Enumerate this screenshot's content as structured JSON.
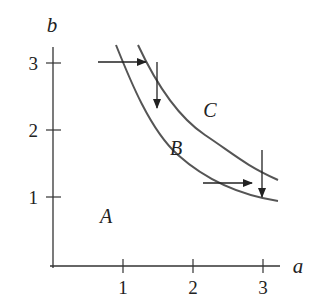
{
  "diagram": {
    "axes": {
      "x_label": "a",
      "y_label": "b",
      "x_ticks": [
        "1",
        "2",
        "3"
      ],
      "y_ticks": [
        "1",
        "2",
        "3"
      ]
    },
    "regions": {
      "A": "A",
      "B": "B",
      "C": "C"
    },
    "curves": [
      {
        "name": "inner-curve",
        "equation": "ab = 3"
      },
      {
        "name": "outer-curve",
        "equation": "ab = 4"
      }
    ],
    "arrows": [
      {
        "name": "upper-horizontal-arrow",
        "direction": "right"
      },
      {
        "name": "upper-vertical-arrow",
        "direction": "down"
      },
      {
        "name": "lower-horizontal-arrow",
        "direction": "right"
      },
      {
        "name": "lower-vertical-arrow",
        "direction": "down"
      }
    ],
    "colors": {
      "axis": "#333333",
      "curve": "#555555",
      "text": "#222222"
    }
  }
}
